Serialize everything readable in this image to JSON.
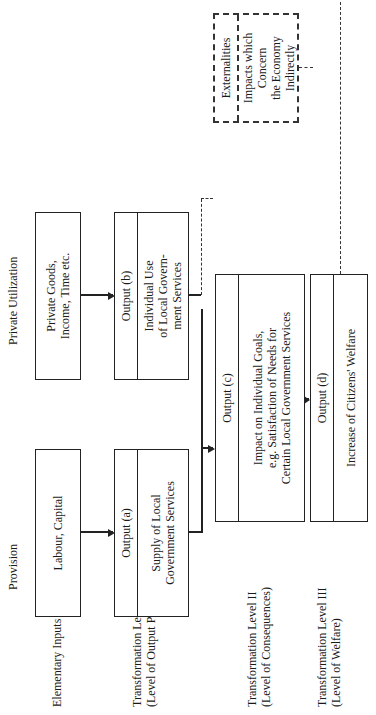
{
  "columns": {
    "provision": "Provision",
    "private_utilization": "Private Utilization"
  },
  "rows": [
    {
      "label": "Elementary Inputs"
    },
    {
      "label": "Transformation Level I",
      "sub": "(Level of Output Proper)"
    },
    {
      "label": "Transformation Level II",
      "sub": "(Level of Consequences)"
    },
    {
      "label": "Transformation Level III",
      "sub": "(Level of Welfare)"
    }
  ],
  "boxes": {
    "labour_capital": "Labour, Capital",
    "private_goods": [
      "Private Goods,",
      "Income, Time etc."
    ],
    "output_a": {
      "title": "Output (a)",
      "body": [
        "Supply of Local",
        "Government Services"
      ]
    },
    "output_b": {
      "title": "Output (b)",
      "body": [
        "Individual Use",
        "of Local Govern-",
        "ment Services"
      ]
    },
    "output_c": {
      "title": "Output (c)",
      "body": [
        "Impact on Individual Goals,",
        "e.g. Satisfaction of Needs for",
        "Certain Local Government Services"
      ]
    },
    "output_d": {
      "title": "Output (d)",
      "body": [
        "Increase of Citizens' Welfare"
      ]
    },
    "externalities": {
      "title": "Externalities",
      "body": [
        "Impacts which Concern",
        "the Economy Indirectly"
      ]
    }
  }
}
